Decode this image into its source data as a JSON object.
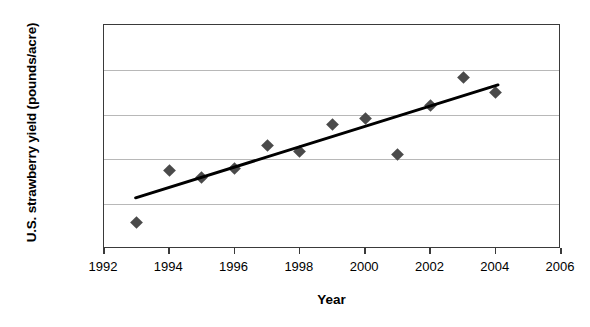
{
  "chart_data": {
    "type": "scatter",
    "title": "",
    "xlabel": "Year",
    "ylabel": "U.S. strawberry yield (pounds/acre)",
    "xlim": [
      1992,
      2006
    ],
    "ylim": [
      25000,
      50000
    ],
    "xticks": [
      1992,
      1994,
      1996,
      1998,
      2000,
      2002,
      2004,
      2006
    ],
    "xtick_labels": [
      "1992",
      "1994",
      "1996",
      "1998",
      "2000",
      "2002",
      "2004",
      "2006"
    ],
    "yticks": [
      25000,
      30000,
      35000,
      40000,
      45000,
      50000
    ],
    "ytick_labels": [
      "25,000",
      "30,000",
      "35,000",
      "40,000",
      "45,000",
      "50,000"
    ],
    "grid": "horizontal",
    "legend": "none",
    "marker_shape": "diamond",
    "marker_color": "#4a4a4a",
    "trendline_color": "#000000",
    "x": [
      1993,
      1994,
      1995,
      1996,
      1997,
      1998,
      1999,
      2000,
      2001,
      2002,
      2003,
      2004
    ],
    "values": [
      28000,
      33800,
      33000,
      34000,
      36600,
      35900,
      38900,
      39600,
      35500,
      41000,
      44100,
      42500
    ],
    "points": [
      {
        "year": 1993,
        "yield": 28000
      },
      {
        "year": 1994,
        "yield": 33800
      },
      {
        "year": 1995,
        "yield": 33000
      },
      {
        "year": 1996,
        "yield": 34000
      },
      {
        "year": 1997,
        "yield": 36600
      },
      {
        "year": 1998,
        "yield": 35900
      },
      {
        "year": 1999,
        "yield": 38900
      },
      {
        "year": 2000,
        "yield": 39600
      },
      {
        "year": 2001,
        "yield": 35500
      },
      {
        "year": 2002,
        "yield": 41000
      },
      {
        "year": 2003,
        "yield": 44100
      },
      {
        "year": 2004,
        "yield": 42500
      }
    ],
    "trendline": {
      "x_start": 1993,
      "y_start": 30600,
      "x_end": 2004.1,
      "y_end": 43200
    }
  }
}
